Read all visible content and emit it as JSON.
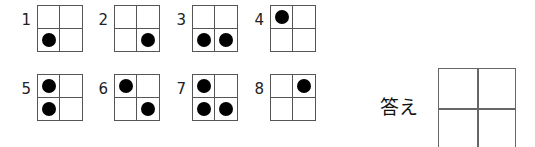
{
  "puzzles": [
    {
      "number": "1",
      "cells": [
        0,
        0,
        1,
        0
      ]
    },
    {
      "number": "2",
      "cells": [
        0,
        0,
        0,
        1
      ]
    },
    {
      "number": "3",
      "cells": [
        0,
        0,
        1,
        1
      ]
    },
    {
      "number": "4",
      "cells": [
        1,
        0,
        0,
        0
      ]
    },
    {
      "number": "5",
      "cells": [
        1,
        0,
        1,
        0
      ]
    },
    {
      "number": "6",
      "cells": [
        1,
        0,
        0,
        1
      ]
    },
    {
      "number": "7",
      "cells": [
        1,
        0,
        1,
        1
      ]
    },
    {
      "number": "8",
      "cells": [
        0,
        1,
        0,
        0
      ]
    }
  ],
  "answer": {
    "label": "答え",
    "cells": [
      0,
      0,
      0,
      0
    ]
  },
  "colors": {
    "dot": "#000000",
    "grid_line": "#555555"
  }
}
